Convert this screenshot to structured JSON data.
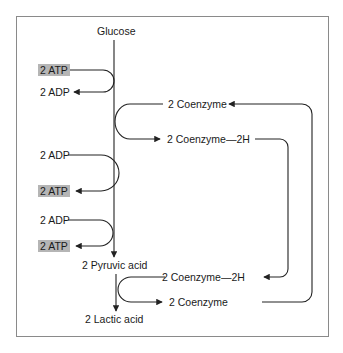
{
  "diagram": {
    "type": "metabolic-pathway",
    "colors": {
      "line": "#222222",
      "frame": "#8a8a8a",
      "atp_highlight": "#b5b5b5"
    },
    "main_pathway": {
      "start": "Glucose",
      "intermediate": "2 Pyruvic acid",
      "end": "2 Lactic acid"
    },
    "energy_steps": [
      {
        "input": "2 ATP",
        "output": "2 ADP",
        "highlight": "input"
      },
      {
        "input": "2 ADP",
        "output": "2 ATP",
        "highlight": "output"
      },
      {
        "input": "2 ADP",
        "output": "2 ATP",
        "highlight": "output"
      }
    ],
    "coenzyme_cycle": {
      "upper": {
        "input": "2 Coenzyme",
        "output": "2 Coenzyme—2H"
      },
      "lower": {
        "input": "2 Coenzyme—2H",
        "output": "2 Coenzyme"
      }
    }
  }
}
